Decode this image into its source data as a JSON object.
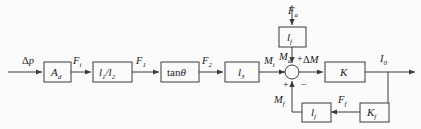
{
  "diagram": {
    "type": "control-block-diagram",
    "stroke_color": "#3a3a3a",
    "background_color": "#fbfbfb",
    "blocks": [
      {
        "id": "Ad",
        "label": "A",
        "sub": "d",
        "x": 44,
        "y": 62,
        "w": 27,
        "h": 20
      },
      {
        "id": "l1l2",
        "label": "l",
        "sub": "1/l2",
        "x": 93,
        "y": 62,
        "w": 39,
        "h": 20
      },
      {
        "id": "tantheta",
        "label": "tan",
        "sub": "",
        "x": 161,
        "y": 62,
        "w": 38,
        "h": 20
      },
      {
        "id": "l3",
        "label": "l",
        "sub": "3",
        "x": 225,
        "y": 62,
        "w": 34,
        "h": 20
      },
      {
        "id": "K",
        "label": "K",
        "sub": "",
        "x": 325,
        "y": 62,
        "w": 40,
        "h": 20
      },
      {
        "id": "lf_top",
        "label": "l",
        "sub": "f",
        "x": 279,
        "y": 27,
        "w": 27,
        "h": 20
      },
      {
        "id": "lf_bot",
        "label": "l",
        "sub": "f",
        "x": 302,
        "y": 103,
        "w": 27,
        "h": 19
      },
      {
        "id": "Kf",
        "label": "K",
        "sub": "f",
        "x": 360,
        "y": 103,
        "w": 27,
        "h": 19
      }
    ],
    "block_labels": {
      "Ad": "A_d",
      "l1l2": "l_1/l_2",
      "tantheta": "tanθ",
      "l3": "l_3",
      "K": "K",
      "lf_top": "l_f",
      "lf_bot": "l_f",
      "Kf": "K_f"
    },
    "signals": [
      {
        "id": "dp",
        "base": "Δp",
        "sub": "",
        "x": 22,
        "y": 61
      },
      {
        "id": "Fi",
        "base": "F",
        "sub": "i",
        "x": 72,
        "y": 61
      },
      {
        "id": "F1",
        "base": "F",
        "sub": "1",
        "x": 135,
        "y": 61
      },
      {
        "id": "F2",
        "base": "F",
        "sub": "2",
        "x": 201,
        "y": 61
      },
      {
        "id": "Mt",
        "base": "M",
        "sub": "t",
        "x": 264,
        "y": 61
      },
      {
        "id": "dM",
        "base": "ΔM",
        "sub": "",
        "x": 300,
        "y": 60
      },
      {
        "id": "I0",
        "base": "I",
        "sub": "0",
        "x": 381,
        "y": 58
      },
      {
        "id": "Fa",
        "base": "F",
        "sub": "a",
        "x": 288,
        "y": 12
      },
      {
        "id": "Ma",
        "base": "M",
        "sub": "a",
        "x": 280,
        "y": 58
      },
      {
        "id": "Mf",
        "base": "M",
        "sub": "f",
        "x": 276,
        "y": 101
      },
      {
        "id": "Ff",
        "base": "F",
        "sub": "f",
        "x": 337,
        "y": 101
      }
    ],
    "signal_text": {
      "dp": "Δp",
      "Fi": "F_i",
      "F1": "F_1",
      "F2": "F_2",
      "Mt": "M_t",
      "dM": "ΔM",
      "I0": "I_0",
      "Fa": "F_a",
      "Ma": "M_a",
      "Mf": "M_f",
      "Ff": "F_f"
    },
    "summing_junction": {
      "cx": 292,
      "cy": 72,
      "r": 7,
      "signs": [
        {
          "id": "plus-top",
          "text": "+",
          "x": 297,
          "y": 62
        },
        {
          "id": "plus-bottom",
          "text": "+",
          "x": 283,
          "y": 87
        },
        {
          "id": "minus-right",
          "text": "−",
          "x": 301,
          "y": 87
        }
      ]
    }
  }
}
